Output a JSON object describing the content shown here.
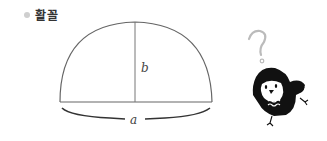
{
  "heading": {
    "text": "활꼴",
    "bullet_color": "#cfcfcf"
  },
  "diagram": {
    "shape": "circular-segment",
    "labels": {
      "height": "b",
      "chord": "a"
    },
    "stroke_color": "#555555"
  },
  "mascot": {
    "name": "owl",
    "accessory": "question-mark"
  }
}
